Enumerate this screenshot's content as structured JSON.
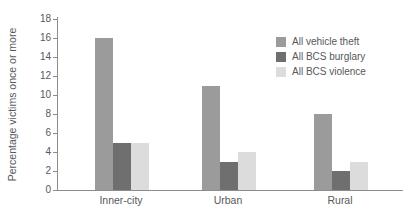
{
  "chart_data": {
    "type": "bar",
    "title": "",
    "ylabel": "Percentage victims once or more",
    "xlabel": "",
    "categories": [
      "Inner-city",
      "Urban",
      "Rural"
    ],
    "series": [
      {
        "name": "All vehicle theft",
        "color": "#9b9b9b",
        "values": [
          16,
          11,
          8
        ]
      },
      {
        "name": "All BCS burglary",
        "color": "#6f6f6f",
        "values": [
          5,
          3,
          2
        ]
      },
      {
        "name": "All BCS violence",
        "color": "#dcdcdc",
        "values": [
          5,
          4,
          3
        ]
      }
    ],
    "ylim": [
      0,
      18
    ],
    "ytick_step": 2,
    "grid": "off",
    "legend_position": "upper-right",
    "axis_color": "#8c8c8c",
    "text_color": "#57585a"
  }
}
